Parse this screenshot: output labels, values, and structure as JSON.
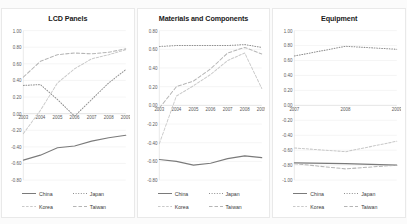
{
  "figure": {
    "background": "#fbfbfb",
    "panel_background": "#ffffff",
    "series_styles": [
      {
        "name": "China",
        "dash": "none",
        "color": "#7a7a7a",
        "width": 1.0
      },
      {
        "name": "Japan",
        "dash": "1,1.6",
        "color": "#8f8f8f",
        "width": 0.9
      },
      {
        "name": "Korea",
        "dash": "2.5,1.6",
        "color": "#c9c9c9",
        "width": 0.9
      },
      {
        "name": "Taiwan",
        "dash": "3.5,2",
        "color": "#b5b5b5",
        "width": 0.9
      }
    ]
  },
  "legend_common": {
    "items": [
      {
        "label": "China",
        "style": "solid"
      },
      {
        "label": "Japan",
        "style": "dotted"
      },
      {
        "label": "Korea",
        "style": "dashdot"
      },
      {
        "label": "Taiwan",
        "style": "dashed"
      }
    ]
  },
  "chart_data": [
    {
      "type": "line",
      "title": "LCD Panels",
      "xlabel": "",
      "ylabel": "",
      "x": [
        2003,
        2004,
        2005,
        2006,
        2007,
        2008,
        2009
      ],
      "xticklabels": [
        "2003",
        "2004",
        "2005",
        "2006",
        "2007",
        "2008",
        "2009"
      ],
      "ylim": [
        -0.8,
        1.0
      ],
      "yticks": [
        1.0,
        0.8,
        0.6,
        0.4,
        0.2,
        0.0,
        -0.2,
        -0.4,
        -0.6,
        -0.8
      ],
      "yticklabels": [
        "1.00",
        "0.80",
        "0.60",
        "0.40",
        "0.20",
        "0.00",
        "-0.20",
        "-0.40",
        "-0.60",
        "-0.80"
      ],
      "grid": true,
      "legend_position": "bottom",
      "series": [
        {
          "name": "China",
          "values": [
            -0.56,
            -0.5,
            -0.41,
            -0.39,
            -0.33,
            -0.29,
            -0.26
          ]
        },
        {
          "name": "Japan",
          "values": [
            0.34,
            0.35,
            0.17,
            -0.03,
            0.17,
            0.37,
            0.53
          ]
        },
        {
          "name": "Korea",
          "values": [
            -0.24,
            0.04,
            0.37,
            0.54,
            0.66,
            0.71,
            0.77
          ]
        },
        {
          "name": "Taiwan",
          "values": [
            0.44,
            0.63,
            0.71,
            0.73,
            0.72,
            0.74,
            0.78
          ]
        }
      ]
    },
    {
      "type": "line",
      "title": "Materials and Components",
      "xlabel": "",
      "ylabel": "",
      "x": [
        2003,
        2004,
        2005,
        2006,
        2007,
        2008,
        2009
      ],
      "xticklabels": [
        "2003",
        "2004",
        "2005",
        "2006",
        "2007",
        "2008",
        "2009"
      ],
      "ylim": [
        -0.8,
        0.8
      ],
      "yticks": [
        0.8,
        0.6,
        0.4,
        0.2,
        0.0,
        -0.2,
        -0.4,
        -0.6,
        -0.8
      ],
      "yticklabels": [
        "0.80",
        "0.60",
        "0.40",
        "0.20",
        "0.00",
        "-0.20",
        "-0.40",
        "-0.60",
        "-0.80"
      ],
      "grid": true,
      "legend_position": "bottom",
      "series": [
        {
          "name": "China",
          "values": [
            -0.58,
            -0.6,
            -0.64,
            -0.62,
            -0.57,
            -0.54,
            -0.56
          ]
        },
        {
          "name": "Japan",
          "values": [
            0.63,
            0.64,
            0.64,
            0.64,
            0.64,
            0.65,
            0.62
          ]
        },
        {
          "name": "Korea",
          "values": [
            -0.41,
            0.1,
            0.21,
            0.33,
            0.48,
            0.56,
            0.18
          ]
        },
        {
          "name": "Taiwan",
          "values": [
            -0.03,
            0.2,
            0.26,
            0.39,
            0.56,
            0.62,
            0.55
          ]
        }
      ]
    },
    {
      "type": "line",
      "title": "Equipment",
      "xlabel": "",
      "ylabel": "",
      "x": [
        2007,
        2008,
        2009
      ],
      "xticklabels": [
        "2007",
        "2008",
        "2009"
      ],
      "ylim": [
        -1.0,
        1.0
      ],
      "yticks": [
        1.0,
        0.8,
        0.6,
        0.4,
        0.2,
        0.0,
        -0.2,
        -0.4,
        -0.6,
        -0.8,
        -1.0
      ],
      "yticklabels": [
        "1.00",
        "0.80",
        "0.60",
        "0.40",
        "0.20",
        "0.00",
        "-0.20",
        "-0.40",
        "-0.60",
        "-0.80",
        "-1.00"
      ],
      "grid": true,
      "legend_position": "bottom",
      "series": [
        {
          "name": "China",
          "values": [
            -0.77,
            -0.78,
            -0.8
          ]
        },
        {
          "name": "Japan",
          "values": [
            0.66,
            0.79,
            0.75
          ]
        },
        {
          "name": "Korea",
          "values": [
            -0.57,
            -0.62,
            -0.48
          ]
        },
        {
          "name": "Taiwan",
          "values": [
            -0.78,
            -0.85,
            -0.8
          ]
        }
      ]
    }
  ]
}
